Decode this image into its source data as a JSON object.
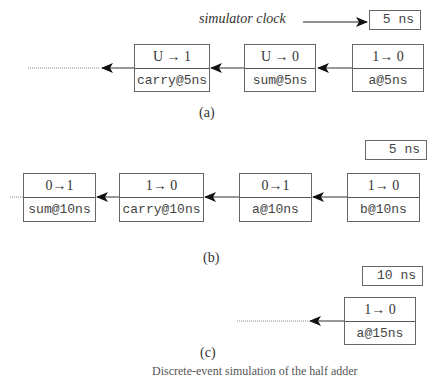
{
  "panel_a": {
    "clock_label": "simulator clock",
    "clock_value": "5 ns",
    "events": [
      {
        "transition": "U → 1",
        "signal": "carry@5ns"
      },
      {
        "transition": "U → 0",
        "signal": "sum@5ns"
      },
      {
        "transition": "1→ 0",
        "signal": "a@5ns"
      }
    ],
    "caption": "(a)"
  },
  "panel_b": {
    "clock_value": "5 ns",
    "events": [
      {
        "transition": "0→1",
        "signal": "sum@10ns"
      },
      {
        "transition": "1→ 0",
        "signal": "carry@10ns"
      },
      {
        "transition": "0→1",
        "signal": "a@10ns"
      },
      {
        "transition": "1→ 0",
        "signal": "b@10ns"
      }
    ],
    "caption": "(b)"
  },
  "panel_c": {
    "clock_value": "10 ns",
    "events": [
      {
        "transition": "1→ 0",
        "signal": "a@15ns"
      }
    ],
    "caption": "(c)"
  },
  "figure_caption_partial": "Discrete-event simulation of the half adder"
}
